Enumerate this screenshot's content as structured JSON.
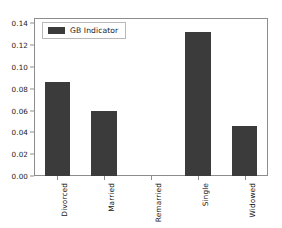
{
  "chart_data": {
    "type": "bar",
    "title": "",
    "xlabel": "",
    "ylabel": "",
    "categories": [
      "Divorced",
      "Married",
      "Remarried",
      "Single",
      "Widowed"
    ],
    "values": [
      0.086,
      0.06,
      0.0,
      0.132,
      0.046
    ],
    "series": [
      {
        "name": "GB Indicator",
        "values": [
          0.086,
          0.06,
          0.0,
          0.132,
          0.046
        ],
        "color": "#3b3b3b"
      }
    ],
    "ylim": [
      0.0,
      0.145
    ],
    "yticks": [
      0.0,
      0.02,
      0.04,
      0.06,
      0.08,
      0.1,
      0.12,
      0.14
    ],
    "ytick_labels": [
      "0.00",
      "0.02",
      "0.04",
      "0.06",
      "0.08",
      "0.10",
      "0.12",
      "0.14"
    ],
    "grid": false,
    "legend": {
      "entries": [
        "GB Indicator"
      ],
      "position": "upper left"
    },
    "xtick_rotation": -90,
    "frame_color": "#8d8d8d",
    "background": "#ffffff"
  }
}
